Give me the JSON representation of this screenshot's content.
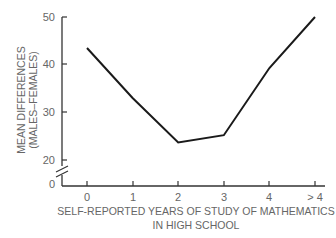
{
  "chart_data": {
    "type": "line",
    "title": "",
    "xlabel": "SELF-REPORTED YEARS OF STUDY OF MATHEMATICS IN HIGH SCHOOL",
    "xlabel_lines": [
      "SELF-REPORTED YEARS OF STUDY OF MATHEMATICS",
      "IN HIGH SCHOOL"
    ],
    "ylabel": "MEAN DIFFERENCES (MALES–FEMALES)",
    "ylabel_lines": [
      "MEAN DIFFERENCES",
      "(MALES–FEMALES)"
    ],
    "categories": [
      "0",
      "1",
      "2",
      "3",
      "4",
      "> 4"
    ],
    "series": [
      {
        "name": "Mean differences (males–females)",
        "values": [
          43.5,
          33,
          23.7,
          25.2,
          39.3,
          50
        ]
      }
    ],
    "y_ticks": [
      0,
      20,
      30,
      40,
      50
    ],
    "y_tick_labels": [
      "0",
      "20",
      "30",
      "40",
      "50"
    ],
    "ylim": [
      0,
      50
    ],
    "y_axis_break": "between 0 and 20",
    "grid": false,
    "legend": "none",
    "line_color": "#1a1a1a"
  }
}
